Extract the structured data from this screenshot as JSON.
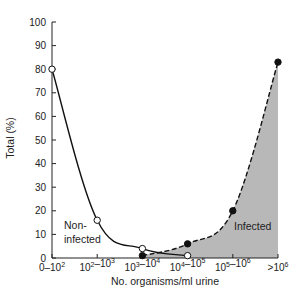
{
  "chart_data": {
    "type": "line",
    "title": "",
    "xlabel": "No. organisms/ml urine",
    "ylabel": "Total (%)",
    "ylim": [
      0,
      100
    ],
    "yticks": [
      0,
      10,
      20,
      30,
      40,
      50,
      60,
      70,
      80,
      90,
      100
    ],
    "categories": [
      "0–10²",
      "10²–10³",
      "10³–10⁴",
      "10⁴–10⁵",
      "10⁵–10⁶",
      ">10⁶"
    ],
    "grid": false,
    "legend": "none (inline annotations)",
    "series": [
      {
        "name": "Non-infected",
        "marker": "open-circle",
        "line": "solid",
        "x": [
          "0–10²",
          "10²–10³",
          "10³–10⁴",
          "10⁴–10⁵"
        ],
        "values": [
          80,
          16,
          4,
          1
        ]
      },
      {
        "name": "Infected",
        "marker": "filled-circle",
        "line": "dashed",
        "fill": "shaded area under curve",
        "x": [
          "10³–10⁴",
          "10⁴–10⁵",
          "10⁵–10⁶",
          ">10⁶"
        ],
        "values": [
          1,
          6,
          20,
          83
        ]
      }
    ],
    "annotations": [
      {
        "text": "Non-",
        "series": "Non-infected"
      },
      {
        "text": "infected",
        "series": "Non-infected"
      },
      {
        "text": "Infected",
        "series": "Infected"
      }
    ]
  },
  "labels": {
    "ylabel": "Total (%)",
    "xlabel": "No. organisms/ml urine",
    "noninfected_line1": "Non-",
    "noninfected_line2": "infected",
    "infected": "Infected"
  },
  "colors": {
    "axis": "#222222",
    "line": "#111111",
    "fill": "#b8b8b8"
  }
}
